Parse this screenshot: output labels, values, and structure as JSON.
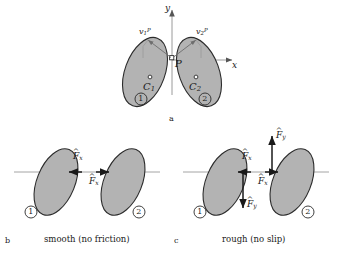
{
  "figure": {
    "type": "physics-diagram"
  },
  "panel_a": {
    "letter": "a",
    "axis_x": "x",
    "axis_y": "y",
    "contact_point": "P",
    "body1": {
      "center": "C",
      "center_sub": "1",
      "number": "1"
    },
    "body2": {
      "center": "C",
      "center_sub": "2",
      "number": "2"
    },
    "velocity1": {
      "symbol": "v",
      "sub": "1",
      "sup": "P"
    },
    "velocity2": {
      "symbol": "v",
      "sub": "2",
      "sup": "P"
    }
  },
  "panel_b": {
    "letter": "b",
    "caption": "smooth (no friction)",
    "body1_number": "1",
    "body2_number": "2",
    "force_left": {
      "symbol": "F",
      "sub": "x",
      "accent": "hat"
    },
    "force_right": {
      "symbol": "F",
      "sub": "x",
      "accent": "hat"
    }
  },
  "panel_c": {
    "letter": "c",
    "caption": "rough (no slip)",
    "body1_number": "1",
    "body2_number": "2",
    "force_x_left": {
      "symbol": "F",
      "sub": "x",
      "accent": "hat"
    },
    "force_x_right": {
      "symbol": "F",
      "sub": "x",
      "accent": "hat"
    },
    "force_y_down": {
      "symbol": "F",
      "sub": "y",
      "accent": "hat"
    },
    "force_y_up": {
      "symbol": "F",
      "sub": "y",
      "accent": "hat"
    }
  },
  "colors": {
    "body_fill": "#b3b3b3",
    "body_stroke": "#2b2b2b",
    "axis": "#9a9a9a",
    "arrow": "#1a1a1a",
    "background": "#ffffff"
  }
}
